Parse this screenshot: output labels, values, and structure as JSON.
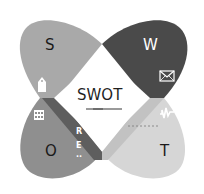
{
  "diagram": {
    "title": "SWOT",
    "quadrants": [
      {
        "key": "S",
        "label": "S",
        "color": "#a9a9a9",
        "icon": "tag-icon"
      },
      {
        "key": "W",
        "label": "W",
        "color": "#4a4a4a",
        "icon": "envelope-icon"
      },
      {
        "key": "O",
        "label": "O",
        "color": "#8f8f8f",
        "icon": "calendar-icon"
      },
      {
        "key": "T",
        "label": "T",
        "color": "#d6d6d6",
        "icon": "graph-icon"
      }
    ],
    "band_letters": [
      "R",
      "E",
      ".."
    ],
    "colors": {
      "s": "#a9a9a9",
      "w": "#4a4a4a",
      "o": "#8f8f8f",
      "t": "#d6d6d6",
      "band_dark": "#5e5e5e",
      "band_light": "#c2c2c2",
      "center": "#ffffff"
    }
  }
}
